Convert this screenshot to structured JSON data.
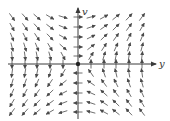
{
  "figure": {
    "type": "direction-field",
    "system": {
      "dy_dt": "v",
      "dv_dt": "y"
    },
    "x_axis_label": "y",
    "y_axis_label": "v",
    "origin_px": [
      78,
      64
    ],
    "grid_x_px": [
      12,
      25,
      37,
      50,
      63,
      78,
      91,
      104,
      116,
      129,
      142
    ],
    "grid_y_px": [
      17,
      27,
      37,
      47,
      56,
      64,
      73,
      83,
      93,
      103,
      112
    ],
    "arrow_length_px": 9,
    "colors": {
      "axis": "#3a3a3a",
      "arrow": "#4a4a4a",
      "background": "#ffffff"
    }
  }
}
